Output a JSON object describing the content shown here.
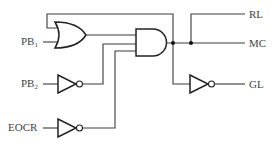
{
  "diagram": {
    "type": "logic-circuit",
    "inputs": [
      {
        "id": "PB1",
        "label": "PB",
        "sub": "1"
      },
      {
        "id": "PB2",
        "label": "PB",
        "sub": "2"
      },
      {
        "id": "EOCR",
        "label": "EOCR",
        "sub": ""
      }
    ],
    "outputs": [
      {
        "id": "RL",
        "label": "RL"
      },
      {
        "id": "MC",
        "label": "MC"
      },
      {
        "id": "GL",
        "label": "GL"
      }
    ],
    "gates": [
      {
        "id": "or1",
        "type": "OR",
        "inputs": [
          "PB1",
          "feedback(MC)"
        ]
      },
      {
        "id": "not1",
        "type": "NOT",
        "inputs": [
          "PB2"
        ]
      },
      {
        "id": "not2",
        "type": "NOT",
        "inputs": [
          "EOCR"
        ]
      },
      {
        "id": "and1",
        "type": "AND",
        "inputs": [
          "or1",
          "not1",
          "not2"
        ]
      },
      {
        "id": "not3",
        "type": "NOT",
        "inputs": [
          "and1"
        ]
      }
    ],
    "connections": [
      "and1 -> MC",
      "and1 -> RL",
      "and1 -> feedback -> or1",
      "and1 -> not3 -> GL"
    ]
  }
}
